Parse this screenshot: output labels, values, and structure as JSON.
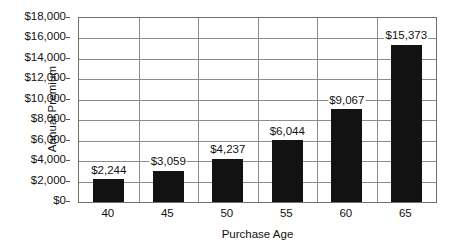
{
  "chart_data": {
    "type": "bar",
    "title": "",
    "xlabel": "Purchase Age",
    "ylabel": "Annual Premium",
    "categories": [
      "40",
      "45",
      "50",
      "55",
      "60",
      "65"
    ],
    "values": [
      2244,
      3059,
      4237,
      6044,
      9067,
      15373
    ],
    "value_labels": [
      "$2,244",
      "$3,059",
      "$4,237",
      "$6,044",
      "$9,067",
      "$15,373"
    ],
    "ylim": [
      0,
      18000
    ],
    "ytick_step": 2000,
    "ytick_labels": [
      "$18,000",
      "$16,000",
      "$14,000",
      "$12,000",
      "$10,000",
      "$8,000",
      "$6,000",
      "$4,000",
      "$2,000",
      "$0"
    ],
    "ytick_values": [
      18000,
      16000,
      14000,
      12000,
      10000,
      8000,
      6000,
      4000,
      2000,
      0
    ],
    "grid": "horizontal-and-category-dividers",
    "legend": "none",
    "series_color": "#121212",
    "grid_color": "#8c8c8c",
    "axis_color": "#6e6e6e",
    "background": "#ffffff"
  }
}
